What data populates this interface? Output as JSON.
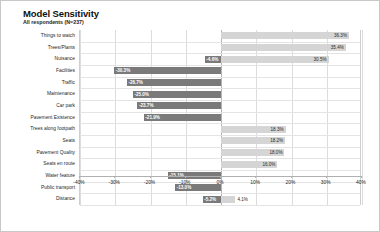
{
  "chart_data": {
    "type": "bar",
    "orientation": "horizontal",
    "variant": "diverging",
    "title": "Model Sensitivity",
    "subtitle": "All respondents (N=237)",
    "xlabel": "",
    "ylabel": "",
    "xlim": [
      -40,
      40
    ],
    "grid": true,
    "legend": false,
    "tick_labels": [
      "-40%",
      "-30%",
      "-20%",
      "-10%",
      "0%",
      "10%",
      "20%",
      "30%",
      "40%"
    ],
    "tick_values": [
      -40,
      -30,
      -20,
      -10,
      0,
      10,
      20,
      30,
      40
    ],
    "categories": [
      "Things to watch",
      "Trees/Plants",
      "Nuisance",
      "Facilities",
      "Traffic",
      "Maintenance",
      "Car park",
      "Pavement Existence",
      "Trees along footpath",
      "Seats",
      "Pavement Quality",
      "Seats en route",
      "Water feature",
      "Public transport",
      "Distance"
    ],
    "series": [
      {
        "name": "positive",
        "color": "#d5d5d5",
        "values": [
          36.3,
          35.4,
          30.5,
          null,
          null,
          null,
          null,
          null,
          18.3,
          18.2,
          18.0,
          16.0,
          null,
          null,
          4.1
        ]
      },
      {
        "name": "negative",
        "color": "#7a7a7a",
        "values": [
          null,
          null,
          -4.6,
          -30.3,
          -26.7,
          -25.0,
          -23.7,
          -21.9,
          null,
          null,
          null,
          null,
          -15.1,
          -13.0,
          -5.2
        ]
      }
    ],
    "rows": [
      {
        "label": "Things to watch",
        "pos": 36.3,
        "pos_label": "36.3%",
        "neg": null,
        "neg_label": null
      },
      {
        "label": "Trees/Plants",
        "pos": 35.4,
        "pos_label": "35.4%",
        "neg": null,
        "neg_label": null
      },
      {
        "label": "Nuisance",
        "pos": 30.5,
        "pos_label": "30.5%",
        "neg": -4.6,
        "neg_label": "-4.6%"
      },
      {
        "label": "Facilities",
        "pos": null,
        "pos_label": null,
        "neg": -30.3,
        "neg_label": "-30.3%"
      },
      {
        "label": "Traffic",
        "pos": null,
        "pos_label": null,
        "neg": -26.7,
        "neg_label": "-26.7%"
      },
      {
        "label": "Maintenance",
        "pos": null,
        "pos_label": null,
        "neg": -25.0,
        "neg_label": "-25.0%"
      },
      {
        "label": "Car park",
        "pos": null,
        "pos_label": null,
        "neg": -23.7,
        "neg_label": "-23.7%"
      },
      {
        "label": "Pavement Existence",
        "pos": null,
        "pos_label": null,
        "neg": -21.9,
        "neg_label": "-21.9%"
      },
      {
        "label": "Trees along footpath",
        "pos": 18.3,
        "pos_label": "18.3%",
        "neg": null,
        "neg_label": null
      },
      {
        "label": "Seats",
        "pos": 18.2,
        "pos_label": "18.2%",
        "neg": null,
        "neg_label": null
      },
      {
        "label": "Pavement Quality",
        "pos": 18.0,
        "pos_label": "18.0%",
        "neg": null,
        "neg_label": null
      },
      {
        "label": "Seats en route",
        "pos": 16.0,
        "pos_label": "16.0%",
        "neg": null,
        "neg_label": null
      },
      {
        "label": "Water feature",
        "pos": null,
        "pos_label": null,
        "neg": -15.1,
        "neg_label": "-15.1%"
      },
      {
        "label": "Public transport",
        "pos": null,
        "pos_label": null,
        "neg": -13.0,
        "neg_label": "-13.0%"
      },
      {
        "label": "Distance",
        "pos": 4.1,
        "pos_label": "4.1%",
        "neg": -5.2,
        "neg_label": "-5.2%"
      }
    ],
    "colors": {
      "positive_bar": "#d5d5d5",
      "negative_bar": "#7a7a7a",
      "grid": "#dcdcdc",
      "axis": "#b0b0b0",
      "border": "#c8c8c8",
      "text": "#1a1a1a"
    }
  }
}
